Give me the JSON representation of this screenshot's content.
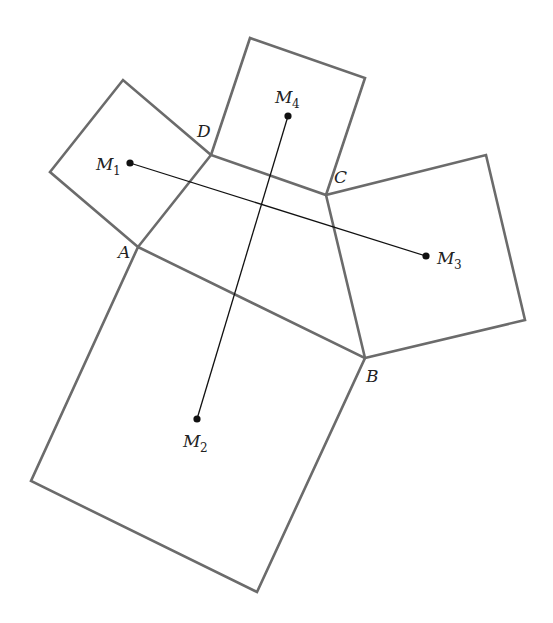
{
  "diagram": {
    "title": "",
    "colors": {
      "square_stroke": "#6b6b6b",
      "segment_stroke": "#111111",
      "background": "#ffffff"
    },
    "vertices": {
      "A": {
        "label": "A",
        "x": 138,
        "y": 247
      },
      "B": {
        "label": "B",
        "x": 365,
        "y": 358
      },
      "C": {
        "label": "C",
        "x": 326,
        "y": 195
      },
      "D": {
        "label": "D",
        "x": 211,
        "y": 155
      }
    },
    "squares": [
      {
        "name": "square-on-AD",
        "points": "138,247 50,172 123,80 211,155"
      },
      {
        "name": "square-on-AB",
        "points": "138,247 365,358 257,592 31,481"
      },
      {
        "name": "square-on-BC",
        "points": "365,358 525,320 486,155 326,195"
      },
      {
        "name": "square-on-CD",
        "points": "326,195 365,78 250,38 211,155"
      }
    ],
    "quadrilateral": {
      "name": "ABCD",
      "points": "138,247 365,358 326,195 211,155"
    },
    "midpoints": [
      {
        "id": "M1",
        "base": "M",
        "sub": "1",
        "x": 130,
        "y": 163,
        "label_x": 96,
        "label_y": 170,
        "sub_x": 113,
        "sub_y": 175
      },
      {
        "id": "M2",
        "base": "M",
        "sub": "2",
        "x": 197,
        "y": 419,
        "label_x": 183,
        "label_y": 447,
        "sub_x": 200,
        "sub_y": 452
      },
      {
        "id": "M3",
        "base": "M",
        "sub": "3",
        "x": 426,
        "y": 256,
        "label_x": 437,
        "label_y": 264,
        "sub_x": 454,
        "sub_y": 269
      },
      {
        "id": "M4",
        "base": "M",
        "sub": "4",
        "x": 288,
        "y": 116,
        "label_x": 275,
        "label_y": 103,
        "sub_x": 292,
        "sub_y": 108
      }
    ],
    "segments": [
      {
        "name": "M1-M3",
        "from": "M1",
        "to": "M3",
        "x1": 130,
        "y1": 163,
        "x2": 426,
        "y2": 256
      },
      {
        "name": "M2-M4",
        "from": "M2",
        "to": "M4",
        "x1": 197,
        "y1": 419,
        "x2": 288,
        "y2": 116
      }
    ],
    "vertex_labels": [
      {
        "text": "A",
        "x": 118,
        "y": 258
      },
      {
        "text": "B",
        "x": 366,
        "y": 382
      },
      {
        "text": "C",
        "x": 334,
        "y": 183
      },
      {
        "text": "D",
        "x": 197,
        "y": 137
      }
    ]
  }
}
